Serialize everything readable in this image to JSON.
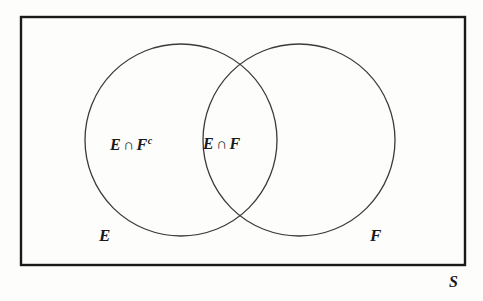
{
  "figure": {
    "type": "venn-diagram",
    "background_color": "#fdfdfc",
    "stroke_color": "#1a1a1a",
    "text_color": "#1a1a1a"
  },
  "universe": {
    "label": "S",
    "shape": "rectangle",
    "x": 21,
    "y": 17,
    "width": 444,
    "height": 248,
    "border_width": 2
  },
  "sets": [
    {
      "key": "E",
      "label": "E",
      "cx": 181,
      "cy": 140,
      "r": 96
    },
    {
      "key": "F",
      "label": "F",
      "cx": 299,
      "cy": 140,
      "r": 96
    }
  ],
  "regions": {
    "e_only": {
      "base": "E",
      "operator": "∩",
      "other": "F",
      "superscript": "c"
    },
    "intersection": {
      "base": "E",
      "operator": "∩",
      "other": "F"
    }
  },
  "chart_data": {
    "type": "diagram",
    "title": "",
    "subtype": "venn",
    "universe": "S",
    "sets": [
      "E",
      "F"
    ],
    "shaded_regions": [],
    "labelled_regions": [
      {
        "text": "E ∩ Fᶜ",
        "meaning": "elements in E but not in F",
        "x": 160,
        "y": 145
      },
      {
        "text": "E ∩ F",
        "meaning": "elements in both E and F",
        "x": 242,
        "y": 145
      }
    ],
    "annotations": [
      {
        "text": "E",
        "x": 105,
        "y": 236
      },
      {
        "text": "F",
        "x": 376,
        "y": 236
      },
      {
        "text": "S",
        "x": 455,
        "y": 285
      }
    ]
  }
}
